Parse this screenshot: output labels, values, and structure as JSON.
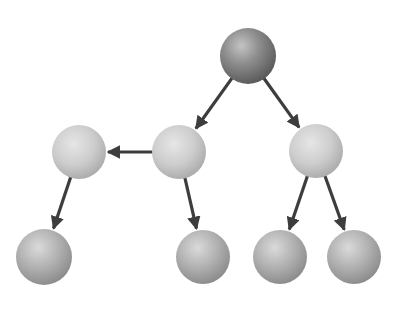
{
  "diagram": {
    "type": "tree",
    "background": "#ffffff",
    "edge_color": "#3d3d3d",
    "nodes": [
      {
        "id": "root",
        "cx": 248,
        "cy": 56,
        "r": 28,
        "shade": "dark"
      },
      {
        "id": "mid-a",
        "cx": 79,
        "cy": 152,
        "r": 27,
        "shade": "light"
      },
      {
        "id": "mid-b",
        "cx": 179,
        "cy": 152,
        "r": 27,
        "shade": "light"
      },
      {
        "id": "mid-c",
        "cx": 316,
        "cy": 151,
        "r": 27,
        "shade": "light"
      },
      {
        "id": "leaf-1",
        "cx": 44,
        "cy": 257,
        "r": 28,
        "shade": "medium"
      },
      {
        "id": "leaf-2",
        "cx": 203,
        "cy": 257,
        "r": 27,
        "shade": "medium"
      },
      {
        "id": "leaf-3",
        "cx": 280,
        "cy": 257,
        "r": 27,
        "shade": "medium"
      },
      {
        "id": "leaf-4",
        "cx": 354,
        "cy": 257,
        "r": 27,
        "shade": "medium"
      }
    ],
    "edges": [
      {
        "from": "root",
        "to": "mid-b"
      },
      {
        "from": "root",
        "to": "mid-c"
      },
      {
        "from": "mid-b",
        "to": "mid-a"
      },
      {
        "from": "mid-a",
        "to": "leaf-1"
      },
      {
        "from": "mid-b",
        "to": "leaf-2"
      },
      {
        "from": "mid-c",
        "to": "leaf-3"
      },
      {
        "from": "mid-c",
        "to": "leaf-4"
      }
    ]
  }
}
